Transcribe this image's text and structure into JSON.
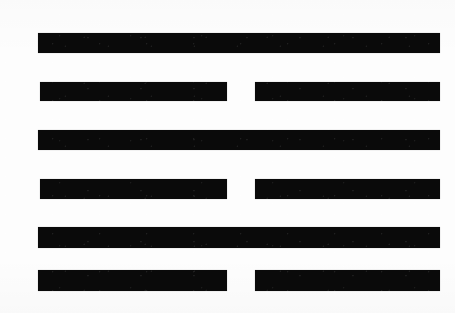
{
  "figure": {
    "kind": "iching-hexagram",
    "background_color": "#fdfdfd",
    "ink_color": "#0a0a0a",
    "width": 455,
    "height": 313,
    "line_count": 6,
    "reading_order": "top-to-bottom",
    "pattern_top_to_bottom": [
      "yang",
      "yin",
      "yang",
      "yin",
      "yang",
      "yin"
    ]
  },
  "chart_data": {
    "type": "bar",
    "xlabel": "",
    "ylabel": "",
    "grid": false,
    "legend": "none",
    "categories": [
      "line-1",
      "line-2",
      "line-3",
      "line-4",
      "line-5",
      "line-6"
    ],
    "values": [
      1,
      0,
      1,
      0,
      1,
      0
    ]
  },
  "lines": [
    {
      "index": 1,
      "type": "yang",
      "label": "solid-line",
      "top": 33,
      "height": 20,
      "segments": [
        {
          "name": "full",
          "left": 38,
          "width": 402
        }
      ]
    },
    {
      "index": 2,
      "type": "yin",
      "label": "broken-line",
      "top": 82,
      "height": 19,
      "segments": [
        {
          "name": "left",
          "left": 40,
          "width": 187
        },
        {
          "name": "right",
          "left": 255,
          "width": 185
        }
      ]
    },
    {
      "index": 3,
      "type": "yang",
      "label": "solid-line",
      "top": 130,
      "height": 20,
      "segments": [
        {
          "name": "full",
          "left": 38,
          "width": 402
        }
      ]
    },
    {
      "index": 4,
      "type": "yin",
      "label": "broken-line",
      "top": 179,
      "height": 20,
      "segments": [
        {
          "name": "left",
          "left": 40,
          "width": 187
        },
        {
          "name": "right",
          "left": 255,
          "width": 185
        }
      ]
    },
    {
      "index": 5,
      "type": "yang",
      "label": "solid-line",
      "top": 227,
      "height": 21,
      "segments": [
        {
          "name": "full",
          "left": 38,
          "width": 402
        }
      ]
    },
    {
      "index": 6,
      "type": "yin",
      "label": "broken-line",
      "top": 270,
      "height": 21,
      "segments": [
        {
          "name": "left",
          "left": 38,
          "width": 189
        },
        {
          "name": "right",
          "left": 255,
          "width": 185
        }
      ]
    }
  ]
}
